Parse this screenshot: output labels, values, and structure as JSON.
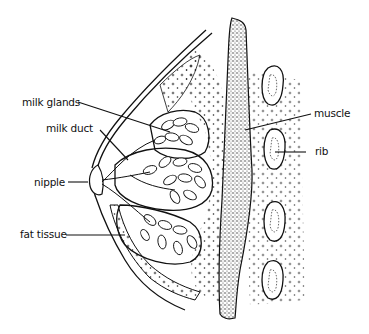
{
  "diagram": {
    "type": "anatomical cross-section",
    "colors": {
      "ink": "#111111",
      "background": "#ffffff"
    },
    "labels": [
      {
        "id": "milk-glands",
        "text": "milk glands",
        "side": "left"
      },
      {
        "id": "milk-duct",
        "text": "milk duct",
        "side": "left"
      },
      {
        "id": "nipple",
        "text": "nipple",
        "side": "left"
      },
      {
        "id": "fat-tissue",
        "text": "fat tissue",
        "side": "left"
      },
      {
        "id": "muscle",
        "text": "muscle",
        "side": "right"
      },
      {
        "id": "rib",
        "text": "rib",
        "side": "right"
      }
    ]
  }
}
